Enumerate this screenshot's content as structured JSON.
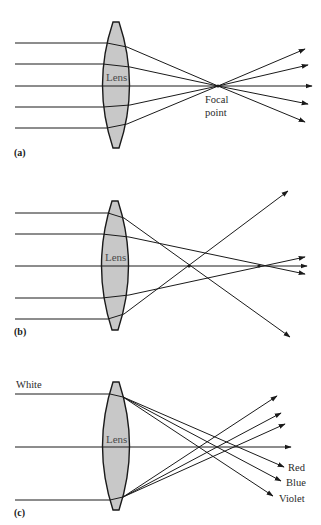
{
  "figure": {
    "panels": [
      {
        "id": "a",
        "label": "(a)",
        "lens_label": "Lens",
        "annotation_line1": "Focal",
        "annotation_line2": "point",
        "description": "Parallel rays converge to a single focal point"
      },
      {
        "id": "b",
        "label": "(b)",
        "lens_label": "Lens",
        "description": "Spherical aberration: outer rays focus closer than inner rays"
      },
      {
        "id": "c",
        "label": "(c)",
        "lens_label": "Lens",
        "input_label": "White",
        "output_labels": [
          "Red",
          "Blue",
          "Violet"
        ],
        "description": "Chromatic aberration: white light splits into colors with different focal points"
      }
    ]
  },
  "colors": {
    "ink": "#1a1a1a",
    "lens_fill": "#c8c8c8",
    "background": "#ffffff"
  }
}
